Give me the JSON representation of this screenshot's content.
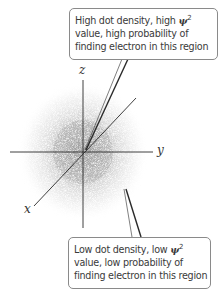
{
  "diagram": {
    "axes": {
      "z_label": "z",
      "y_label": "y",
      "x_label": "x"
    },
    "callouts": {
      "top": {
        "line1_pre": "High dot density, high ",
        "psi": "ψ",
        "sup": "2",
        "line2": "value, high probability of",
        "line3": "finding electron in this region"
      },
      "bottom": {
        "line1_pre": "Low dot density, low ",
        "psi": "ψ",
        "sup": "2",
        "line2": "value, low probability of",
        "line3": "finding electron in this region"
      }
    },
    "colors": {
      "axis": "#2a2a2a",
      "dots": "#8c8c8c",
      "callout_border": "#8a8a8a",
      "text": "#3a3a3a"
    }
  }
}
